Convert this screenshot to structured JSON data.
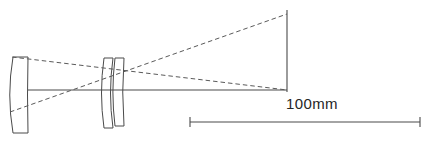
{
  "figure": {
    "type": "optical-ray-diagram",
    "title": "",
    "background_color": "#ffffff",
    "line_color": "#4a4a4a",
    "dash_color": "#5a5a5a",
    "text_color": "#262626",
    "width": 427,
    "height": 141
  },
  "scale_bar": {
    "label": "100mm",
    "x_start": 190,
    "x_end": 420,
    "y": 122,
    "tick_half_height": 5
  },
  "optical_axis": {
    "y": 90,
    "x_start": 28,
    "x_end": 287
  },
  "image_plane": {
    "x": 287,
    "y_top": 10,
    "y_bottom": 92,
    "label": ""
  },
  "elements": [
    {
      "name": "front-biconvex-lens",
      "type": "biconvex",
      "x_left": 13,
      "x_right": 28,
      "y_top": 57,
      "y_bottom": 133
    },
    {
      "name": "rear-meniscus-element-1",
      "type": "meniscus",
      "x_left": 104,
      "x_right": 113,
      "y_top": 58,
      "y_bottom": 128
    },
    {
      "name": "rear-meniscus-element-2",
      "type": "meniscus",
      "x_left": 115,
      "x_right": 124,
      "y_top": 58,
      "y_bottom": 126
    }
  ],
  "rays": [
    {
      "name": "upper-marginal-ray",
      "style": "dashed",
      "x1": 12,
      "y1": 57,
      "x2": 287,
      "y2": 90
    },
    {
      "name": "lower-marginal-ray",
      "style": "dashed",
      "x1": 10,
      "y1": 112,
      "x2": 287,
      "y2": 14
    }
  ]
}
